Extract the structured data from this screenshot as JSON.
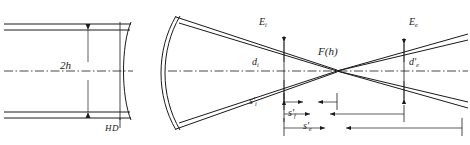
{
  "figure": {
    "background_color": "#ffffff",
    "line_color": "#1a1a1a",
    "width": 470,
    "height": 145
  },
  "labels": {
    "beam_height": {
      "text": "2h",
      "symbol": "2",
      "italic_part": "h"
    },
    "lens_plane": {
      "text": "HD"
    },
    "entrance_marker": {
      "base": "E",
      "sub": "i"
    },
    "entrance_diameter": {
      "base": "d",
      "sub": "i",
      "prime": ""
    },
    "focus": {
      "text": "F(h)"
    },
    "exit_marker": {
      "base": "E",
      "sub": "e"
    },
    "exit_diameter": {
      "base": "d",
      "sub": "e",
      "prime": "'"
    },
    "dim_si": {
      "base": "s",
      "prime": "'",
      "sub": "i"
    },
    "dim_sf": {
      "base": "s",
      "prime": "'",
      "sub": "f"
    },
    "dim_se": {
      "base": "s",
      "prime": "'",
      "sub": "e"
    }
  },
  "geometry": {
    "optical_axis_y": 71,
    "beam_top_y": 28,
    "beam_bottom_y": 114,
    "lens1_x": 128,
    "lens2_x": 162,
    "plane_ei_x": 284,
    "focus_x": 337,
    "plane_ee_x": 404,
    "dim_si_span": [
      284,
      337
    ],
    "dim_sf_span": [
      284,
      404
    ],
    "dim_se_span": [
      284,
      462
    ]
  }
}
